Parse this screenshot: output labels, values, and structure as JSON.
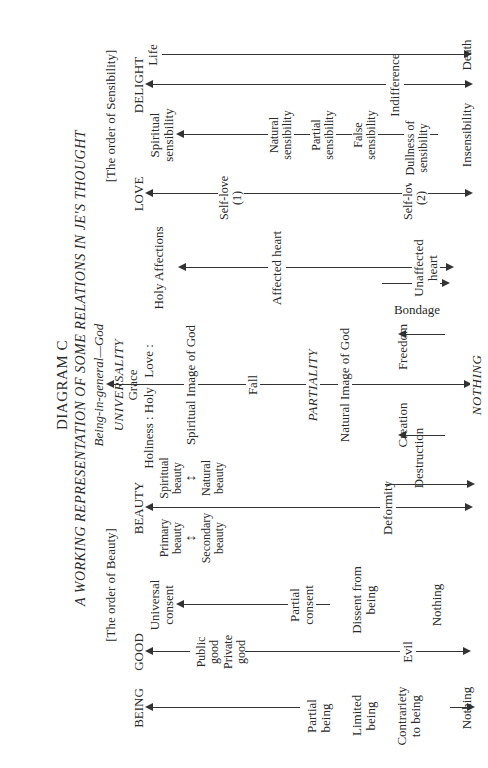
{
  "title": {
    "diagram": "DIAGRAM C",
    "subtitle": "A WORKING REPRESENTATION OF SOME RELATIONS IN JE'S THOUGHT",
    "top": "Being-in-general—God"
  },
  "orders": {
    "beauty": "[The order of Beauty]",
    "sensibility": "[The order of Sensibility]"
  },
  "columns": {
    "being": {
      "heading": "BEING",
      "labels": [
        "Partial being",
        "Limited being",
        "Contrariety to being",
        "Nothing"
      ]
    },
    "good": {
      "heading": "GOOD",
      "labels": [
        "Public good",
        "Private good",
        "Evil"
      ]
    },
    "consent": {
      "labels": [
        "Universal consent",
        "Partial consent",
        "Dissent from being",
        "Nothing"
      ]
    },
    "beauty": {
      "heading": "BEAUTY",
      "labels": [
        "Primary beauty",
        "Secondary beauty",
        "Spiritual beauty",
        "Natural beauty",
        "Deformity"
      ]
    },
    "universality": {
      "heading": "UNIVERSALITY",
      "grace": "Grace",
      "holiness": "Holiness : Holy",
      "love": "Love :",
      "spiritual_image": "Spiritual Image of God",
      "fall": "Fall",
      "partiality": "PARTIALITY",
      "natural_image": "Natural Image of God",
      "bondage": "Bondage",
      "freedom": "Freedom",
      "creation": "Creation",
      "destruction": "Destruction",
      "nothing": "NOTHING"
    },
    "affections": {
      "labels": [
        "Holy Affections",
        "Affected heart",
        "Unaffected heart"
      ]
    },
    "love": {
      "heading": "LOVE",
      "labels": [
        "Self-love (1)",
        "Self-love (2)"
      ]
    },
    "sensibility": {
      "labels": [
        "Spiritual sensibility",
        "Natural sensibility",
        "Partial sensibility",
        "False sensibility",
        "Dullness of sensibility",
        "Insensibility"
      ]
    },
    "delight": {
      "heading": "DELIGHT",
      "labels": [
        "Indifference"
      ]
    },
    "life": {
      "labels": [
        "Life",
        "Death"
      ]
    }
  }
}
